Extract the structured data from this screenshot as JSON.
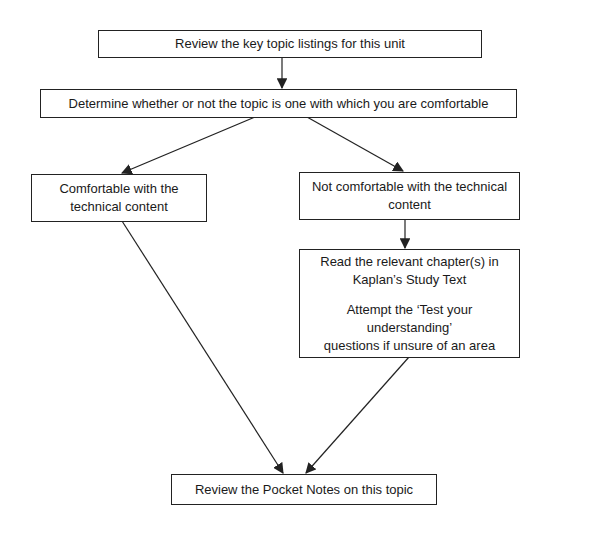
{
  "diagram": {
    "type": "flowchart",
    "nodes": {
      "review_listings": {
        "lines": [
          "Review the key topic listings for this unit"
        ]
      },
      "determine": {
        "lines": [
          "Determine whether or not the topic is one with which you are comfortable"
        ]
      },
      "comfortable": {
        "lines": [
          "Comfortable with the",
          "technical content"
        ]
      },
      "not_comfortable": {
        "lines": [
          "Not comfortable with the technical",
          "content"
        ]
      },
      "study": {
        "para1": [
          "Read the relevant chapter(s) in",
          "Kaplan’s Study Text"
        ],
        "para2": [
          "Attempt the ‘Test your understanding’",
          "questions if unsure of an area"
        ]
      },
      "pocket_notes": {
        "lines": [
          "Review the Pocket Notes on this topic"
        ]
      }
    },
    "edges": [
      {
        "from": "review_listings",
        "to": "determine"
      },
      {
        "from": "determine",
        "to": "comfortable"
      },
      {
        "from": "determine",
        "to": "not_comfortable"
      },
      {
        "from": "not_comfortable",
        "to": "study"
      },
      {
        "from": "comfortable",
        "to": "pocket_notes"
      },
      {
        "from": "study",
        "to": "pocket_notes"
      }
    ],
    "colors": {
      "line": "#222222",
      "background": "#ffffff"
    }
  }
}
